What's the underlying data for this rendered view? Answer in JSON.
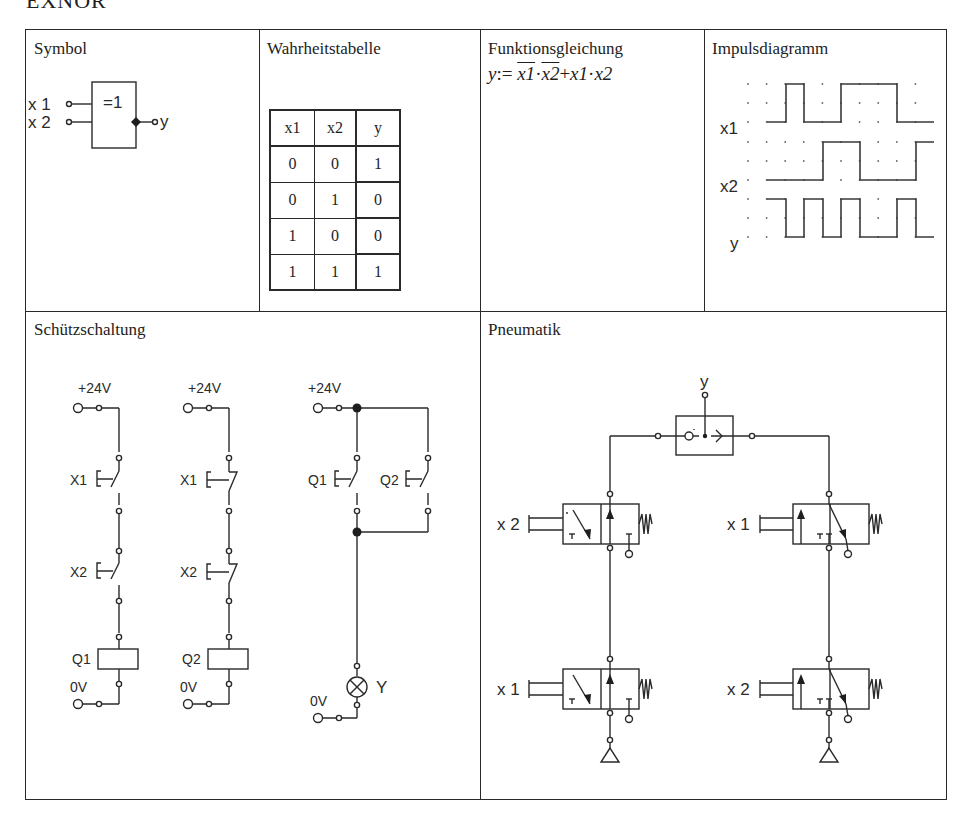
{
  "page": {
    "title": "EXNOR"
  },
  "cells": {
    "symbol": {
      "title": "Symbol",
      "gate_label": "=1",
      "inputs": [
        "x 1",
        "x 2"
      ],
      "output": "y",
      "negated_output": true
    },
    "truth_table": {
      "title": "Wahrheitstabelle",
      "headers": [
        "x1",
        "x2",
        "y"
      ],
      "rows": [
        [
          "0",
          "0",
          "1"
        ],
        [
          "0",
          "1",
          "0"
        ],
        [
          "1",
          "0",
          "0"
        ],
        [
          "1",
          "1",
          "1"
        ]
      ]
    },
    "function_equation": {
      "title": "Funktionsgleichung",
      "lhs": "y",
      "assign": ":=",
      "term1_a": "x1",
      "term1_b": "x2",
      "plus": "+",
      "term2_a": "x1",
      "term2_b": "x2",
      "dot": "·",
      "text": "y := ¬x1 · ¬x2 + x1 · x2"
    },
    "pulse_diagram": {
      "title": "Impulsdiagramm",
      "signal_labels": [
        "x1",
        "x2",
        "y"
      ]
    },
    "contactor_circuit": {
      "title": "Schützschaltung",
      "supply_plus": "+24V",
      "supply_zero": "0V",
      "branch1": {
        "contacts": [
          "X1",
          "X2"
        ],
        "contact_type": "NO",
        "coil": "Q1"
      },
      "branch2": {
        "contacts": [
          "X1",
          "X2"
        ],
        "contact_type": "NC",
        "coil": "Q2"
      },
      "branch3": {
        "contacts": [
          "Q1",
          "Q2"
        ],
        "contact_type": "NO",
        "load": "Y",
        "load_type": "lamp"
      }
    },
    "pneumatics": {
      "title": "Pneumatik",
      "output_label": "y",
      "shuttle_valve": "OR",
      "left_column": {
        "upper_valve": "x 2",
        "lower_valve": "x 1"
      },
      "right_column": {
        "upper_valve": "x 1",
        "lower_valve": "x 2"
      }
    }
  },
  "chart_data": {
    "type": "line",
    "title": "Impulsdiagramm",
    "xlabel": "t",
    "ylabel": "",
    "x": [
      0,
      1,
      2,
      3,
      4,
      5,
      6,
      7,
      8,
      9
    ],
    "series": [
      {
        "name": "x1",
        "values": [
          0,
          1,
          0,
          0,
          1,
          1,
          1,
          0,
          0,
          0
        ]
      },
      {
        "name": "x2",
        "values": [
          0,
          0,
          0,
          1,
          1,
          0,
          0,
          0,
          1,
          1
        ]
      },
      {
        "name": "y",
        "values": [
          1,
          0,
          1,
          0,
          1,
          0,
          0,
          1,
          0,
          0
        ]
      }
    ],
    "ylim": [
      0,
      1
    ],
    "grid": true,
    "legend": "left labels"
  }
}
